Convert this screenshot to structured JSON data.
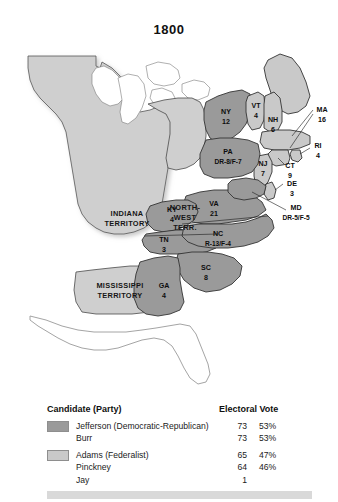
{
  "title": "1800",
  "colors": {
    "jefferson": "#9a9a9a",
    "adams": "#c9c9c9",
    "territory": "#cfcfcf",
    "water": "#ffffff",
    "outline": "#3c3c3c",
    "bottom_bar": "#d9d9d9"
  },
  "map": {
    "states": [
      {
        "code": "VT",
        "votes": "4",
        "party": "adams"
      },
      {
        "code": "NH",
        "votes": "6",
        "party": "adams"
      },
      {
        "code": "MA",
        "votes": "16",
        "party": "adams"
      },
      {
        "code": "RI",
        "votes": "4",
        "party": "adams"
      },
      {
        "code": "CT",
        "votes": "9",
        "party": "adams"
      },
      {
        "code": "NY",
        "votes": "12",
        "party": "jefferson"
      },
      {
        "code": "NJ",
        "votes": "7",
        "party": "adams"
      },
      {
        "code": "PA",
        "votes": "DR-8/F-7",
        "party": "split"
      },
      {
        "code": "DE",
        "votes": "3",
        "party": "adams"
      },
      {
        "code": "MD",
        "votes": "DR-5/F-5",
        "party": "split"
      },
      {
        "code": "VA",
        "votes": "21",
        "party": "jefferson"
      },
      {
        "code": "NC",
        "votes": "R-13/F-4",
        "party": "split"
      },
      {
        "code": "SC",
        "votes": "8",
        "party": "jefferson"
      },
      {
        "code": "GA",
        "votes": "4",
        "party": "jefferson"
      },
      {
        "code": "KY",
        "votes": "4",
        "party": "jefferson"
      },
      {
        "code": "TN",
        "votes": "3",
        "party": "jefferson"
      }
    ],
    "territories": [
      {
        "name_line1": "INDIANA",
        "name_line2": "TERRITORY"
      },
      {
        "name_line1": "NORTH-",
        "name_line2": "WEST",
        "name_line3": "TERR."
      },
      {
        "name_line1": "MISSISSIPPI",
        "name_line2": "TERRITORY"
      }
    ]
  },
  "legend": {
    "header_candidate": "Candidate (Party)",
    "header_votes": "Electoral Vote",
    "rows": [
      {
        "swatch": "jefferson",
        "name": "Jefferson (Democratic-Republican)",
        "votes": "73",
        "pct": "53%"
      },
      {
        "swatch": "none",
        "name": "Burr",
        "votes": "73",
        "pct": "53%"
      },
      {
        "swatch": "adams",
        "name": "Adams (Federalist)",
        "votes": "65",
        "pct": "47%"
      },
      {
        "swatch": "none",
        "name": "Pinckney",
        "votes": "64",
        "pct": "46%"
      },
      {
        "swatch": "none",
        "name": "Jay",
        "votes": "1",
        "pct": ""
      }
    ]
  }
}
